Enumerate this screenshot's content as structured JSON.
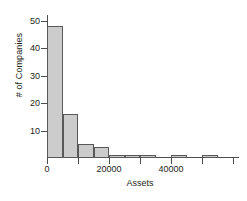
{
  "chart_data": {
    "type": "bar",
    "title": "",
    "subtitle": "",
    "xlabel": "Assets",
    "ylabel": "# of Companies",
    "xlim": [
      0,
      60000
    ],
    "ylim": [
      0,
      52
    ],
    "bin_width": 5000,
    "grid": false,
    "legend": null,
    "bar_fill_color": "#cccccc",
    "bar_edge_color": "#58585b",
    "axis_color": "#4d4d4d",
    "x_major_ticks": [
      0,
      20000,
      40000
    ],
    "x_major_tick_labels": [
      "0",
      "20000",
      "40000"
    ],
    "x_minor_ticks": [
      10000,
      30000,
      50000,
      60000
    ],
    "y_ticks": [
      10,
      20,
      30,
      40,
      50
    ],
    "y_tick_labels": [
      "10",
      "20",
      "30",
      "40",
      "50"
    ],
    "categories": [
      "0-5000",
      "5000-10000",
      "10000-15000",
      "15000-20000",
      "20000-25000",
      "25000-30000",
      "30000-35000",
      "35000-40000",
      "40000-45000",
      "45000-50000",
      "50000-55000",
      "55000-60000"
    ],
    "bin_starts": [
      0,
      5000,
      10000,
      15000,
      20000,
      25000,
      30000,
      35000,
      40000,
      45000,
      50000,
      55000
    ],
    "values": [
      48,
      16,
      5,
      4,
      1,
      1,
      1,
      0,
      1,
      0,
      1,
      0
    ]
  }
}
